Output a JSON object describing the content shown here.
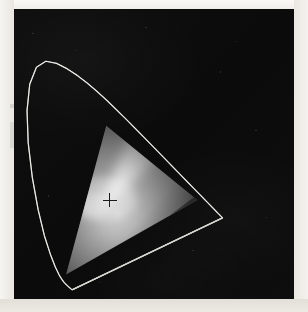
{
  "figure": {
    "title": "CIE 1931 xy chromaticity diagram (grayscale reproduction)",
    "caption": "",
    "background_color": "#050505",
    "paper_color": "#eeece6",
    "outline_color": "#d8d8d2"
  },
  "chart_data": {
    "type": "scatter",
    "title": "CIE 1931 xy chromaticity diagram (grayscale reproduction)",
    "subtitle": "",
    "xlabel": "x",
    "ylabel": "y",
    "xlim": [
      0.0,
      0.8
    ],
    "ylim": [
      0.0,
      0.9
    ],
    "grid": false,
    "legend_position": "none",
    "tick_labels_x": [],
    "tick_labels_y": [],
    "annotations": [
      {
        "name": "white-point",
        "label": "+",
        "marker": "plus",
        "x": 0.3127,
        "y": 0.329,
        "pixel_x": 101,
        "pixel_y": 201,
        "color": "#1a1a1a"
      }
    ],
    "series": [
      {
        "name": "spectral-locus",
        "kind": "outline",
        "closed": true,
        "color": "#d8d8d2",
        "line_width": 1.2,
        "points_xy": [
          [
            0.1741,
            0.005
          ],
          [
            0.174,
            0.005
          ],
          [
            0.1738,
            0.0049
          ],
          [
            0.1736,
            0.0049
          ],
          [
            0.1733,
            0.0048
          ],
          [
            0.173,
            0.0048
          ],
          [
            0.1726,
            0.0048
          ],
          [
            0.1721,
            0.0048
          ],
          [
            0.1714,
            0.0051
          ],
          [
            0.1703,
            0.0058
          ],
          [
            0.1689,
            0.0069
          ],
          [
            0.1669,
            0.0086
          ],
          [
            0.1644,
            0.0109
          ],
          [
            0.1611,
            0.0138
          ],
          [
            0.1566,
            0.0177
          ],
          [
            0.151,
            0.0227
          ],
          [
            0.144,
            0.0297
          ],
          [
            0.1355,
            0.0399
          ],
          [
            0.1241,
            0.0578
          ],
          [
            0.1096,
            0.0868
          ],
          [
            0.0913,
            0.1327
          ],
          [
            0.0687,
            0.2007
          ],
          [
            0.0454,
            0.295
          ],
          [
            0.0235,
            0.4127
          ],
          [
            0.0082,
            0.5384
          ],
          [
            0.0039,
            0.6548
          ],
          [
            0.0139,
            0.7502
          ],
          [
            0.0389,
            0.812
          ],
          [
            0.0743,
            0.8338
          ],
          [
            0.1142,
            0.8262
          ],
          [
            0.1547,
            0.8059
          ],
          [
            0.1929,
            0.7816
          ],
          [
            0.2296,
            0.7543
          ],
          [
            0.2658,
            0.7243
          ],
          [
            0.3016,
            0.6923
          ],
          [
            0.3373,
            0.6589
          ],
          [
            0.3731,
            0.6245
          ],
          [
            0.4087,
            0.5896
          ],
          [
            0.4441,
            0.5547
          ],
          [
            0.4788,
            0.5202
          ],
          [
            0.5125,
            0.4866
          ],
          [
            0.5448,
            0.4544
          ],
          [
            0.5752,
            0.4242
          ],
          [
            0.6029,
            0.3965
          ],
          [
            0.627,
            0.3725
          ],
          [
            0.6482,
            0.3514
          ],
          [
            0.6658,
            0.334
          ],
          [
            0.6801,
            0.3197
          ],
          [
            0.6915,
            0.3083
          ],
          [
            0.7006,
            0.2993
          ],
          [
            0.7079,
            0.292
          ],
          [
            0.714,
            0.2859
          ],
          [
            0.719,
            0.2809
          ],
          [
            0.723,
            0.277
          ],
          [
            0.726,
            0.274
          ],
          [
            0.7283,
            0.2717
          ],
          [
            0.73,
            0.27
          ],
          [
            0.7311,
            0.2689
          ],
          [
            0.732,
            0.268
          ],
          [
            0.7327,
            0.2673
          ],
          [
            0.7334,
            0.2666
          ],
          [
            0.734,
            0.266
          ],
          [
            0.7344,
            0.2656
          ],
          [
            0.7346,
            0.2654
          ],
          [
            0.7347,
            0.2653
          ]
        ]
      },
      {
        "name": "rgb-gamut-triangle",
        "kind": "polygon-filled",
        "closed": true,
        "fill": "grayscale-gradient",
        "edge_color": "#3a3a3a",
        "vertices": [
          {
            "label": "green-primary",
            "x": 0.3,
            "y": 0.6,
            "pixel_x": 110,
            "pixel_y": 127
          },
          {
            "label": "red-primary",
            "x": 0.64,
            "y": 0.33,
            "pixel_x": 193,
            "pixel_y": 212
          },
          {
            "label": "blue-primary",
            "x": 0.15,
            "y": 0.06,
            "pixel_x": 62,
            "pixel_y": 267
          }
        ]
      }
    ]
  },
  "elements": {
    "plot_panel_name": "chromaticity-plot-panel",
    "spectral_locus_name": "spectral-locus-outline",
    "gamut_name": "rgb-gamut-triangle",
    "whitepoint_name": "white-point-marker"
  }
}
